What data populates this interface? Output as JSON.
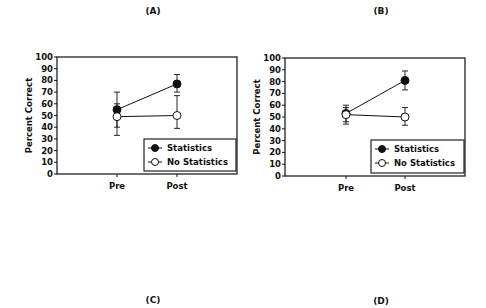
{
  "panels": {
    "A": {
      "label": "(A)"
    },
    "B": {
      "label": "(B)"
    },
    "C": {
      "label": "(C)"
    },
    "D": {
      "label": "(D)"
    }
  },
  "colors": {
    "ink": "#111111",
    "frame": "#222222",
    "open_marker_fill": "#ffffff"
  },
  "chart_data": [
    {
      "panel": "A",
      "type": "line",
      "title": "(A)",
      "xlabel": "",
      "ylabel": "Percent Correct",
      "categories": [
        "Pre",
        "Post"
      ],
      "ylim": [
        0,
        100
      ],
      "yticks": [
        0,
        10,
        20,
        30,
        40,
        50,
        60,
        70,
        80,
        90,
        100
      ],
      "grid": false,
      "legend_position": "lower right",
      "series": [
        {
          "name": "Statistics",
          "marker": "filled-circle",
          "values": [
            55,
            77
          ],
          "error_low": [
            40,
            70
          ],
          "error_high": [
            70,
            85
          ]
        },
        {
          "name": "No Statistics",
          "marker": "open-circle",
          "values": [
            49,
            50
          ],
          "error_low": [
            33,
            39
          ],
          "error_high": [
            60,
            67
          ]
        }
      ]
    },
    {
      "panel": "B",
      "type": "line",
      "title": "(B)",
      "xlabel": "",
      "ylabel": "Percent Correct",
      "categories": [
        "Pre",
        "Post"
      ],
      "ylim": [
        0,
        100
      ],
      "yticks": [
        0,
        10,
        20,
        30,
        40,
        50,
        60,
        70,
        80,
        90,
        100
      ],
      "grid": false,
      "legend_position": "lower right",
      "series": [
        {
          "name": "Statistics",
          "marker": "filled-circle",
          "values": [
            53,
            81
          ],
          "error_low": [
            46,
            73
          ],
          "error_high": [
            60,
            89
          ]
        },
        {
          "name": "No Statistics",
          "marker": "open-circle",
          "values": [
            52,
            50
          ],
          "error_low": [
            44,
            43
          ],
          "error_high": [
            58,
            58
          ]
        }
      ]
    }
  ]
}
